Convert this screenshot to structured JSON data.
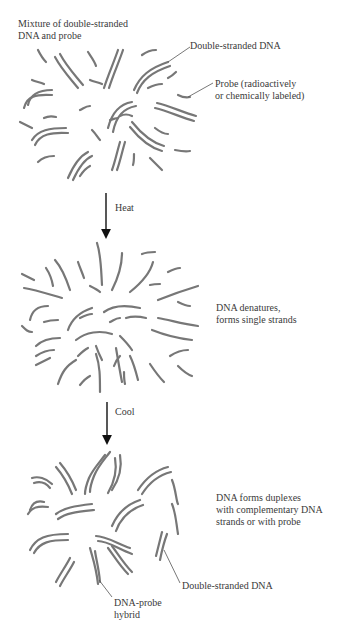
{
  "figure": {
    "stage1": {
      "title_line1": "Mixture of double-stranded",
      "title_line2": "DNA and probe",
      "label_dsdna": "Double-stranded DNA",
      "label_probe_line1": "Probe (radioactively",
      "label_probe_line2": "or chemically labeled)"
    },
    "step1": {
      "label": "Heat",
      "icon": "down-arrow-icon"
    },
    "stage2": {
      "label_line1": "DNA denatures,",
      "label_line2": "forms single strands"
    },
    "step2": {
      "label": "Cool",
      "icon": "down-arrow-icon"
    },
    "stage3": {
      "label_line1": "DNA forms duplexes",
      "label_line2": "with complementary DNA",
      "label_line3": "strands or with probe",
      "label_dsdna": "Double-stranded DNA",
      "label_hybrid_line1": "DNA-probe",
      "label_hybrid_line2": "hybrid"
    },
    "colors": {
      "strand": "#777777",
      "arrow": "#111111",
      "text": "#3a3a3a"
    }
  }
}
